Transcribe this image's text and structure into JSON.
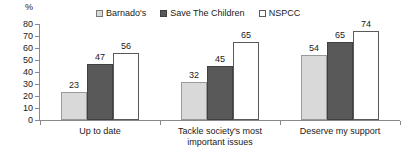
{
  "chart_data": {
    "type": "bar",
    "title": "",
    "subtitle": "",
    "xlabel": "",
    "ylabel": "%",
    "ylim": [
      0,
      80
    ],
    "ytick_step": 10,
    "yticks": [
      "80",
      "70",
      "60",
      "50",
      "40",
      "30",
      "20",
      "10",
      "0"
    ],
    "grid": false,
    "legend_position": "top-center",
    "categories": [
      "Up to date",
      "Tackle society's most important issues",
      "Deserve my support"
    ],
    "category_lines": [
      [
        "Up to date"
      ],
      [
        "Tackle society's most",
        "important issues"
      ],
      [
        "Deserve my support"
      ]
    ],
    "series": [
      {
        "name": "Barnado's",
        "values": [
          23,
          32,
          54
        ],
        "color": "#d9d9d9"
      },
      {
        "name": "Save The Children",
        "values": [
          47,
          45,
          65
        ],
        "color": "#595959"
      },
      {
        "name": "NSPCC",
        "values": [
          56,
          65,
          74
        ],
        "color": "#ffffff"
      }
    ]
  },
  "legend": {
    "items": [
      {
        "label": "Barnado's",
        "swatch": "legend-swatch-barnados"
      },
      {
        "label": "Save The Children",
        "swatch": "legend-swatch-save-the-children"
      },
      {
        "label": "NSPCC",
        "swatch": "legend-swatch-nspcc"
      }
    ]
  },
  "axis": {
    "percent_symbol": "%"
  },
  "colors": {
    "series_1": "#d9d9d9",
    "series_2": "#595959",
    "series_3": "#ffffff",
    "axis": "#8a8a8a",
    "text": "#1a1a1a",
    "background": "#ffffff"
  }
}
